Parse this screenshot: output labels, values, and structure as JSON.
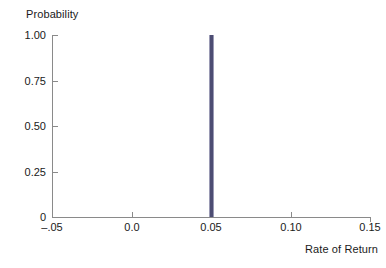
{
  "chart_data": {
    "type": "bar",
    "title": "",
    "subtitle": "",
    "xlabel": "Rate of Return",
    "ylabel": "Probability",
    "xlim": [
      -0.05,
      0.15
    ],
    "ylim": [
      0,
      1.0
    ],
    "grid": false,
    "legend": null,
    "xticks": [
      -0.05,
      0.0,
      0.05,
      0.1,
      0.15
    ],
    "xticklabels": [
      "–.05",
      "0.0",
      "0.05",
      "0.10",
      "0.15"
    ],
    "yticks": [
      0,
      0.25,
      0.5,
      0.75,
      1.0
    ],
    "yticklabels": [
      "0",
      "0.25",
      "0.50",
      "0.75",
      "1.00"
    ],
    "x": [
      0.05
    ],
    "values": [
      1.0
    ],
    "series": [
      {
        "name": "Probability",
        "x": [
          0.05
        ],
        "values": [
          1.0
        ]
      }
    ],
    "bar_color": "#4d4d73",
    "axis_color": "#8a8a8a",
    "background": "#ffffff",
    "annotations": []
  },
  "axes": {
    "y_title": "Probability",
    "x_title": "Rate of Return"
  }
}
